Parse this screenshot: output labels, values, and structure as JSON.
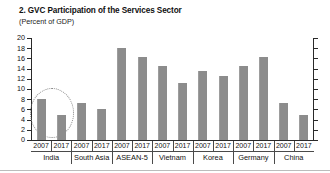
{
  "chart_data": {
    "type": "bar",
    "title": "2. GVC Participation of the Services Sector",
    "subtitle": "(Percent of GDP)",
    "xlabel": "",
    "ylabel": "",
    "ylim": [
      0,
      20
    ],
    "ytick_step": 2,
    "grid": false,
    "legend": "none",
    "bar_color": "#8c8c8c",
    "categories": [
      "India",
      "South Asia",
      "ASEAN-5",
      "Vietnam",
      "Korea",
      "Germany",
      "China"
    ],
    "subcategories": [
      "2007",
      "2017"
    ],
    "yticks": [
      "20",
      "18",
      "16",
      "14",
      "12",
      "10",
      "8",
      "6",
      "4",
      "2",
      "0"
    ],
    "series": [
      {
        "name": "2007",
        "values": [
          8.0,
          7.3,
          18.0,
          14.6,
          13.5,
          14.6,
          7.3
        ]
      },
      {
        "name": "2017",
        "values": [
          5.0,
          6.0,
          16.2,
          11.2,
          12.6,
          16.3,
          5.0
        ]
      }
    ],
    "bars": [
      {
        "group": "India",
        "year": "2007",
        "value": 8.0
      },
      {
        "group": "India",
        "year": "2017",
        "value": 5.0
      },
      {
        "group": "South Asia",
        "year": "2007",
        "value": 7.3
      },
      {
        "group": "South Asia",
        "year": "2017",
        "value": 6.0
      },
      {
        "group": "ASEAN-5",
        "year": "2007",
        "value": 18.0
      },
      {
        "group": "ASEAN-5",
        "year": "2017",
        "value": 16.2
      },
      {
        "group": "Vietnam",
        "year": "2007",
        "value": 14.6
      },
      {
        "group": "Vietnam",
        "year": "2017",
        "value": 11.2
      },
      {
        "group": "Korea",
        "year": "2007",
        "value": 13.5
      },
      {
        "group": "Korea",
        "year": "2017",
        "value": 12.6
      },
      {
        "group": "Germany",
        "year": "2007",
        "value": 14.6
      },
      {
        "group": "Germany",
        "year": "2017",
        "value": 16.3
      },
      {
        "group": "China",
        "year": "2007",
        "value": 7.3
      },
      {
        "group": "China",
        "year": "2017",
        "value": 5.0
      }
    ],
    "annotations": [
      {
        "type": "ellipse",
        "label": "india-highlight",
        "target": "India",
        "style": "dotted"
      }
    ]
  }
}
